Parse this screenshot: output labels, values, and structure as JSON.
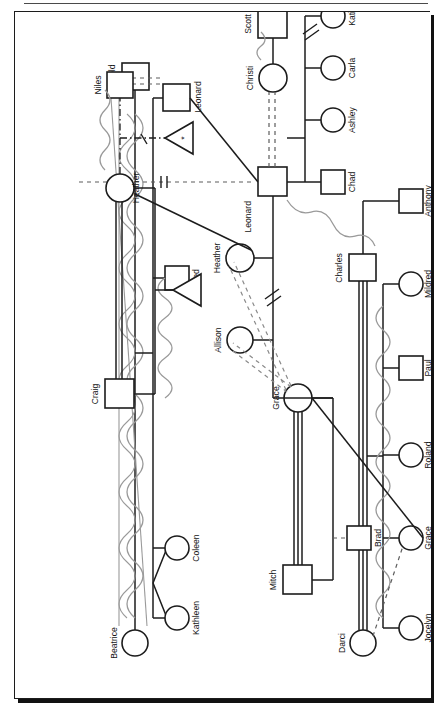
{
  "figure": {
    "title": "Figure 11: Genogram Step 4: Interpersonal and emotional relationships",
    "caption_position": "left-vertical"
  },
  "colors": {
    "ink": "#1c1c1c",
    "frame": "#1c1c1c",
    "shadow": "#111111",
    "emotional_line": "#9a9a9a",
    "background": "#ffffff"
  },
  "legend_semantics": {
    "square": "male",
    "circle": "female",
    "triangle": "pregnancy / unborn",
    "solid_line": "relationship",
    "triple_line": "fused / very close",
    "double_line": "close",
    "dashed_line": "distant",
    "double_dashed_line": "cutoff",
    "dash_dot_line": "tentative",
    "wavy_line": "conflictual",
    "slash_marks": "separation or divorce break"
  },
  "people": [
    {
      "id": "darci",
      "name": "Darci",
      "shape": "circle"
    },
    {
      "id": "jocelyn",
      "name": "Jocelyn",
      "shape": "circle"
    },
    {
      "id": "grace_t",
      "name": "Grace",
      "shape": "circle"
    },
    {
      "id": "roland",
      "name": "Roland",
      "shape": "circle"
    },
    {
      "id": "paul",
      "name": "Paul",
      "shape": "square"
    },
    {
      "id": "mildred",
      "name": "Mildred",
      "shape": "circle"
    },
    {
      "id": "anthony",
      "name": "Anthony",
      "shape": "square"
    },
    {
      "id": "charles",
      "name": "Charles",
      "shape": "square"
    },
    {
      "id": "beatrice",
      "name": "Beatrice",
      "shape": "circle"
    },
    {
      "id": "kathleen",
      "name": "Kathleen",
      "shape": "circle"
    },
    {
      "id": "coleen",
      "name": "Coleen",
      "shape": "circle"
    },
    {
      "id": "fred",
      "name": "Fred",
      "shape": "square"
    },
    {
      "id": "arnold",
      "name": "Arnold",
      "shape": "square"
    },
    {
      "id": "leonard_b",
      "name": "Leonard",
      "shape": "square"
    },
    {
      "id": "mitch",
      "name": "Mitch",
      "shape": "square"
    },
    {
      "id": "brad",
      "name": "Brad",
      "shape": "square"
    },
    {
      "id": "grace_m",
      "name": "Grace",
      "shape": "circle"
    },
    {
      "id": "allison",
      "name": "Allison",
      "shape": "circle"
    },
    {
      "id": "heather_m",
      "name": "Heather",
      "shape": "circle"
    },
    {
      "id": "craig",
      "name": "Craig",
      "shape": "square"
    },
    {
      "id": "heather_b",
      "name": "Heather",
      "shape": "circle"
    },
    {
      "id": "niles",
      "name": "Niles",
      "shape": "square"
    },
    {
      "id": "leonard_m",
      "name": "Leonard",
      "shape": "square"
    },
    {
      "id": "christi",
      "name": "Christi",
      "shape": "circle"
    },
    {
      "id": "scott",
      "name": "Scott",
      "shape": "square"
    },
    {
      "id": "chad",
      "name": "Chad",
      "shape": "square"
    },
    {
      "id": "ashley",
      "name": "Ashley",
      "shape": "circle"
    },
    {
      "id": "carla",
      "name": "Carla",
      "shape": "circle"
    },
    {
      "id": "katie",
      "name": "Katie",
      "shape": "circle"
    }
  ],
  "labels": {
    "darci": "Darci",
    "jocelyn": "Jocelyn",
    "grace_t": "Grace",
    "roland": "Roland",
    "paul": "Paul",
    "mildred": "Mildred",
    "anthony": "Anthony",
    "charles": "Charles",
    "beatrice": "Beatrice",
    "kathleen": "Kathleen",
    "coleen": "Coleen",
    "fred": "Fred",
    "arnold": "Arnold",
    "leonard_b": "Leonard",
    "mitch": "Mitch",
    "brad": "Brad",
    "grace_m": "Grace",
    "allison": "Allison",
    "heather_m": "Heather",
    "craig": "Craig",
    "heather_b": "Heather",
    "niles": "Niles",
    "leonard_m": "Leonard",
    "christi": "Christi",
    "scott": "Scott",
    "chad": "Chad",
    "ashley": "Ashley",
    "carla": "Carla",
    "katie": "Katie",
    "pregnancy_mark": "*"
  },
  "relationships": [
    {
      "from": "grace_m",
      "to": "mitch",
      "style": "triple_line",
      "meaning": "fused"
    },
    {
      "from": "heather_b",
      "to": "craig",
      "style": "double_line",
      "meaning": "close"
    },
    {
      "from": "heather_b",
      "to": "niles",
      "style": "dash_dot_line",
      "meaning": "tentative"
    },
    {
      "from": "darci",
      "to": "charles",
      "style": "triple_line",
      "meaning": "fused"
    },
    {
      "from": "arnold",
      "to": "beatrice",
      "style": "wavy_line",
      "meaning": "conflictual"
    },
    {
      "from": "arnold",
      "to": "leonard_b",
      "style": "double_dashed_line",
      "meaning": "cutoff"
    },
    {
      "from": "leonard_m",
      "to": "christi",
      "style": "double_dashed_line",
      "meaning": "cutoff"
    },
    {
      "from": "scott",
      "to": "christi",
      "style": "wavy_line",
      "meaning": "conflictual"
    },
    {
      "from": "grace_m",
      "to": "allison",
      "style": "double_dashed_line",
      "meaning": "cutoff"
    },
    {
      "from": "grace_m",
      "to": "heather_m",
      "style": "double_dashed_line",
      "meaning": "cutoff"
    },
    {
      "from": "leonard_m",
      "to": "darci",
      "style": "dashed_line",
      "meaning": "distant"
    },
    {
      "from": "leonard_m",
      "to": "heather_m",
      "style": "wavy_line",
      "meaning": "conflictual"
    },
    {
      "from": "heather_b",
      "to": "niles_child",
      "style": "wavy_line",
      "meaning": "conflictual"
    }
  ]
}
